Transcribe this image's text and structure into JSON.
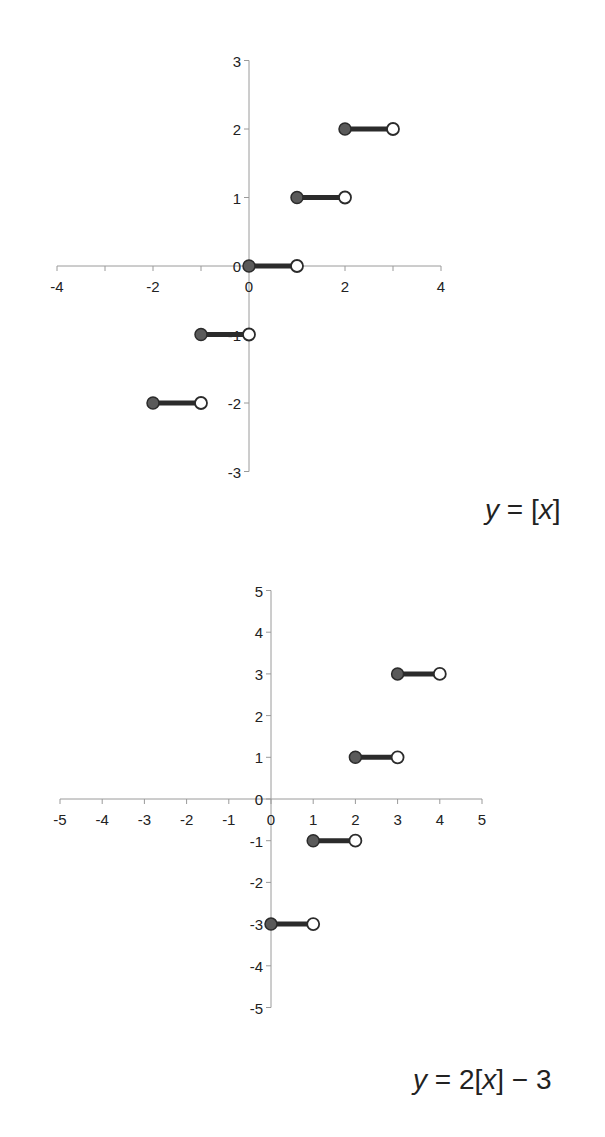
{
  "chart_data": [
    {
      "type": "line",
      "subtype": "step / greatest-integer function",
      "title": "",
      "equation_label": {
        "lhs": "y",
        "eq": " = ",
        "pre": "",
        "bracket_open": "[",
        "var": "x",
        "bracket_close": "]",
        "post": ""
      },
      "xlabel": "",
      "ylabel": "",
      "xlim": [
        -4,
        4
      ],
      "ylim": [
        -3,
        3
      ],
      "x_ticks": [
        -4,
        -3,
        -2,
        -1,
        0,
        1,
        2,
        3,
        4
      ],
      "x_tick_labels": [
        "-4",
        "-2",
        "0",
        "2",
        "4"
      ],
      "x_tick_label_values": [
        -4,
        -2,
        0,
        2,
        4
      ],
      "y_ticks": [
        -3,
        -2,
        -1,
        0,
        1,
        2,
        3
      ],
      "y_tick_labels": [
        "-3",
        "-2",
        "-1",
        "0",
        "1",
        "2",
        "3"
      ],
      "grid": false,
      "legend": null,
      "segments": [
        {
          "x_start": -2,
          "x_end": -1,
          "y": -2,
          "start": "closed",
          "end": "open"
        },
        {
          "x_start": -1,
          "x_end": 0,
          "y": -1,
          "start": "closed",
          "end": "open"
        },
        {
          "x_start": 0,
          "x_end": 1,
          "y": 0,
          "start": "closed",
          "end": "open"
        },
        {
          "x_start": 1,
          "x_end": 2,
          "y": 1,
          "start": "closed",
          "end": "open"
        },
        {
          "x_start": 2,
          "x_end": 3,
          "y": 2,
          "start": "closed",
          "end": "open"
        }
      ],
      "layout": {
        "x0_px": 249,
        "px_per_x": 48,
        "y0_px": 266,
        "px_per_y": 68.5,
        "x_axis_from": -4,
        "x_axis_to": 4,
        "y_axis_from": -3,
        "y_axis_to": 3
      }
    },
    {
      "type": "line",
      "subtype": "step / greatest-integer function",
      "title": "",
      "equation_label": {
        "lhs": "y",
        "eq": " = ",
        "pre": "2",
        "bracket_open": "[",
        "var": "x",
        "bracket_close": "]",
        "post": " − 3"
      },
      "xlabel": "",
      "ylabel": "",
      "xlim": [
        -5,
        5
      ],
      "ylim": [
        -5,
        5
      ],
      "x_ticks": [
        -5,
        -4,
        -3,
        -2,
        -1,
        0,
        1,
        2,
        3,
        4,
        5
      ],
      "x_tick_labels": [
        "-5",
        "-4",
        "-3",
        "-2",
        "-1",
        "0",
        "1",
        "2",
        "3",
        "4",
        "5"
      ],
      "x_tick_label_values": [
        -5,
        -4,
        -3,
        -2,
        -1,
        0,
        1,
        2,
        3,
        4,
        5
      ],
      "y_ticks": [
        -5,
        -4,
        -3,
        -2,
        -1,
        0,
        1,
        2,
        3,
        4,
        5
      ],
      "y_tick_labels": [
        "-5",
        "-4",
        "-3",
        "-2",
        "-1",
        "0",
        "1",
        "2",
        "3",
        "4",
        "5"
      ],
      "grid": false,
      "legend": null,
      "segments": [
        {
          "x_start": 0,
          "x_end": 1,
          "y": -3,
          "start": "closed",
          "end": "open"
        },
        {
          "x_start": 1,
          "x_end": 2,
          "y": -1,
          "start": "closed",
          "end": "open"
        },
        {
          "x_start": 2,
          "x_end": 3,
          "y": 1,
          "start": "closed",
          "end": "open"
        },
        {
          "x_start": 3,
          "x_end": 4,
          "y": 3,
          "start": "closed",
          "end": "open"
        }
      ],
      "layout": {
        "x0_px": 271,
        "px_per_x": 42.2,
        "y0_px": 799,
        "px_per_y": 41.7,
        "x_axis_from": -5,
        "x_axis_to": 5,
        "y_axis_from": -5,
        "y_axis_to": 5
      }
    }
  ],
  "style": {
    "axis_color": "#9a9a9a",
    "segment_color": "#2b2b2b",
    "closed_fill": "#5a5a5a",
    "open_fill": "#ffffff",
    "text_color": "#222222"
  },
  "equations": {
    "chart1": {
      "pos": {
        "left": 485,
        "top": 494
      }
    },
    "chart2": {
      "pos": {
        "left": 413,
        "top": 1064
      }
    }
  }
}
